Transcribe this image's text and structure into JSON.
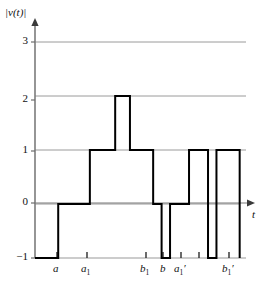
{
  "figure": {
    "y_axis_label": "|v(t)|",
    "x_axis_label": "t"
  },
  "chart_data": {
    "type": "line",
    "title": "",
    "xlabel": "t",
    "ylabel": "|v(t)|",
    "ylim": [
      -1,
      3.4
    ],
    "xlim": [
      0,
      100
    ],
    "grid": true,
    "gridlines_y": [
      0,
      1,
      2,
      3
    ],
    "y_ticks": [
      3,
      2,
      1,
      0,
      -1
    ],
    "y_tick_labels": [
      "3",
      "2",
      "1",
      "0",
      "−1"
    ],
    "x_ticks": [
      11,
      26,
      56,
      64,
      73,
      82,
      97
    ],
    "x_tick_labels": [
      "a",
      "a₁",
      "b₁",
      "b",
      "a₁′",
      "",
      "b₁′"
    ],
    "x_tick_label_parts": [
      {
        "base": "a",
        "sub": "",
        "prime": ""
      },
      {
        "base": "a",
        "sub": "1",
        "prime": ""
      },
      {
        "base": "b",
        "sub": "1",
        "prime": ""
      },
      {
        "base": "b",
        "sub": "",
        "prime": ""
      },
      {
        "base": "a",
        "sub": "1",
        "prime": "′"
      },
      {
        "base": "",
        "sub": "",
        "prime": ""
      },
      {
        "base": "b",
        "sub": "1",
        "prime": "′"
      }
    ],
    "style": "step-post",
    "steps": [
      {
        "x_start": 0,
        "x_end": 11,
        "y": -1
      },
      {
        "x_start": 11,
        "x_end": 26,
        "y": 0
      },
      {
        "x_start": 26,
        "x_end": 38,
        "y": 1
      },
      {
        "x_start": 38,
        "x_end": 45,
        "y": 2
      },
      {
        "x_start": 45,
        "x_end": 56,
        "y": 1
      },
      {
        "x_start": 56,
        "x_end": 60,
        "y": 0
      },
      {
        "x_start": 60,
        "x_end": 64,
        "y": -1
      },
      {
        "x_start": 64,
        "x_end": 73,
        "y": 0
      },
      {
        "x_start": 73,
        "x_end": 82,
        "y": 1
      },
      {
        "x_start": 82,
        "x_end": 86,
        "y": -1
      },
      {
        "x_start": 86,
        "x_end": 97,
        "y": 1
      },
      {
        "x_start": 97,
        "x_end": 100,
        "y": -1
      }
    ],
    "series": [
      {
        "name": "|v(t)|",
        "x": [
          0,
          11,
          11,
          26,
          26,
          38,
          38,
          45,
          45,
          56,
          56,
          60,
          60,
          64,
          64,
          73,
          73,
          82,
          82,
          86,
          86,
          97,
          97
        ],
        "y": [
          -1,
          -1,
          0,
          0,
          1,
          1,
          2,
          2,
          1,
          1,
          0,
          0,
          -1,
          -1,
          0,
          0,
          1,
          1,
          -1,
          -1,
          1,
          1,
          -1
        ]
      }
    ],
    "colors": {
      "curve": "#000000",
      "grid": "#9a9a9a",
      "axis": "#7b7b7b",
      "text": "#111111"
    },
    "line_width": 2
  }
}
